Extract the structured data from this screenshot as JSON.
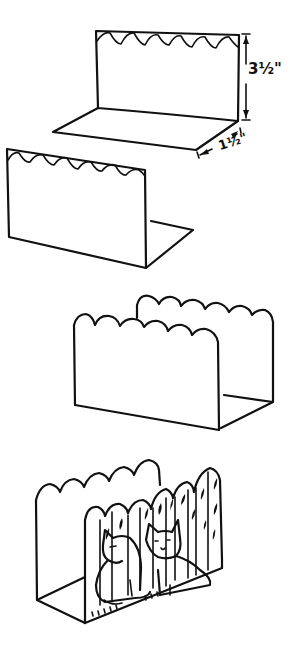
{
  "diagram": {
    "type": "craft-instruction-illustration",
    "steps": [
      {
        "id": "step-1",
        "description": "Bent card: back panel with scalloped top edge, folded base"
      },
      {
        "id": "step-2",
        "description": "Second bent card panel with scalloped top, base folded back"
      },
      {
        "id": "step-3",
        "description": "Two panels assembled into letter holder shape"
      },
      {
        "id": "step-4",
        "description": "Finished letter holder decorated with cats illustration"
      }
    ],
    "dimensions": {
      "height_label": "3½\"",
      "depth_label": "1½\""
    },
    "colors": {
      "line": "#111111",
      "background": "#ffffff"
    }
  }
}
